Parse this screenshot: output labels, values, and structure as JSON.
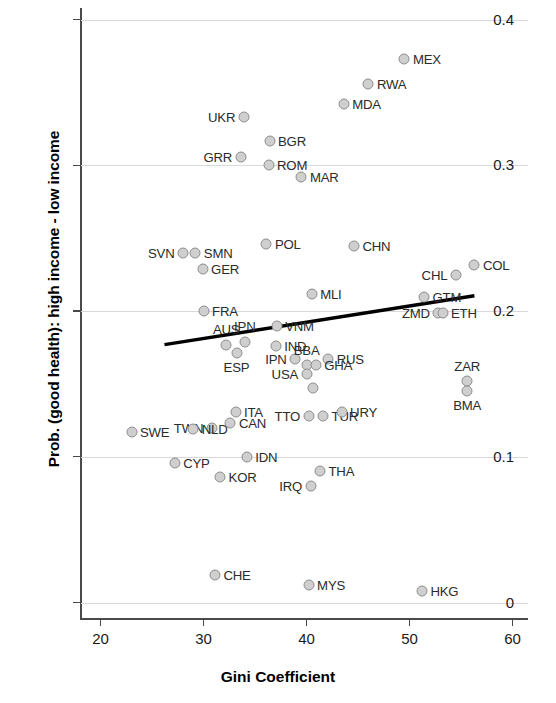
{
  "chart_data": {
    "type": "scatter",
    "title": "",
    "xlabel": "Gini Coefficient",
    "ylabel": "Prob. (good health): high income - low income",
    "xlim": [
      18,
      61.5
    ],
    "ylim": [
      -0.012,
      0.408
    ],
    "xticks": [
      20,
      30,
      40,
      50,
      60
    ],
    "xtick_labels": [
      "20",
      "30",
      "40",
      "50",
      "60"
    ],
    "yticks": [
      0,
      0.1,
      0.2,
      0.3,
      0.4
    ],
    "ytick_labels": [
      "0",
      "0.1",
      "0.2",
      "0.3",
      "0.4"
    ],
    "grid": "horizontal",
    "legend": "none",
    "marker_fill": "#cfcfcf",
    "marker_edge": "#8e8e8e",
    "fit_line_color": "#000000",
    "fit_line": {
      "x0": 26.2,
      "y0": 0.177,
      "x1": 56.3,
      "y1": 0.2105
    },
    "points": [
      {
        "label": "MEX",
        "x": 49.5,
        "y": 0.373,
        "pos": "r"
      },
      {
        "label": "RWA",
        "x": 46.0,
        "y": 0.356,
        "pos": "r"
      },
      {
        "label": "MDA",
        "x": 43.6,
        "y": 0.342,
        "pos": "r"
      },
      {
        "label": "UKR",
        "x": 33.9,
        "y": 0.333,
        "pos": "l"
      },
      {
        "label": "BGR",
        "x": 36.4,
        "y": 0.317,
        "pos": "r"
      },
      {
        "label": "GRR",
        "x": 33.6,
        "y": 0.306,
        "pos": "l"
      },
      {
        "label": "ROM",
        "x": 36.3,
        "y": 0.3,
        "pos": "r"
      },
      {
        "label": "MAR",
        "x": 39.5,
        "y": 0.292,
        "pos": "r"
      },
      {
        "label": "POL",
        "x": 36.1,
        "y": 0.246,
        "pos": "r"
      },
      {
        "label": "CHN",
        "x": 44.6,
        "y": 0.245,
        "pos": "r"
      },
      {
        "label": "SVN",
        "x": 28.0,
        "y": 0.24,
        "pos": "l"
      },
      {
        "label": "SMN",
        "x": 29.2,
        "y": 0.24,
        "pos": "r"
      },
      {
        "label": "COL",
        "x": 56.3,
        "y": 0.232,
        "pos": "r"
      },
      {
        "label": "GER",
        "x": 29.9,
        "y": 0.229,
        "pos": "r"
      },
      {
        "label": "CHL",
        "x": 54.5,
        "y": 0.225,
        "pos": "l"
      },
      {
        "label": "MLI",
        "x": 40.5,
        "y": 0.212,
        "pos": "r"
      },
      {
        "label": "GTM",
        "x": 51.4,
        "y": 0.21,
        "pos": "r"
      },
      {
        "label": "ZMD",
        "x": 52.8,
        "y": 0.199,
        "pos": "l"
      },
      {
        "label": "ETH",
        "x": 53.2,
        "y": 0.199,
        "pos": "r"
      },
      {
        "label": "FRA",
        "x": 30.0,
        "y": 0.2,
        "pos": "r"
      },
      {
        "label": "VNM",
        "x": 37.1,
        "y": 0.19,
        "pos": "r"
      },
      {
        "label": "AUS",
        "x": 32.2,
        "y": 0.177,
        "pos": "t"
      },
      {
        "label": "IPN",
        "x": 34.0,
        "y": 0.179,
        "pos": "t"
      },
      {
        "label": "IND",
        "x": 37.0,
        "y": 0.176,
        "pos": "r"
      },
      {
        "label": "ESP",
        "x": 33.2,
        "y": 0.171,
        "pos": "b"
      },
      {
        "label": "IPN",
        "x": 38.9,
        "y": 0.167,
        "pos": "l"
      },
      {
        "label": "BBA",
        "x": 40.0,
        "y": 0.163,
        "pos": "t"
      },
      {
        "label": "RUS",
        "x": 42.1,
        "y": 0.167,
        "pos": "r"
      },
      {
        "label": "USA",
        "x": 40.0,
        "y": 0.157,
        "pos": "l"
      },
      {
        "label": "GHA",
        "x": 40.9,
        "y": 0.163,
        "pos": "r"
      },
      {
        "label": "ZAR",
        "x": 55.6,
        "y": 0.152,
        "pos": "t"
      },
      {
        "label": "BMA",
        "x": 55.6,
        "y": 0.145,
        "pos": "b"
      },
      {
        "label": "",
        "x": 40.6,
        "y": 0.147,
        "pos": "r"
      },
      {
        "label": "ITA",
        "x": 33.1,
        "y": 0.131,
        "pos": "r"
      },
      {
        "label": "TTO",
        "x": 40.2,
        "y": 0.128,
        "pos": "l"
      },
      {
        "label": "TUR",
        "x": 41.6,
        "y": 0.128,
        "pos": "r"
      },
      {
        "label": "URY",
        "x": 43.4,
        "y": 0.131,
        "pos": "r"
      },
      {
        "label": "CAN",
        "x": 32.6,
        "y": 0.123,
        "pos": "r"
      },
      {
        "label": "TWN",
        "x": 30.8,
        "y": 0.12,
        "pos": "l"
      },
      {
        "label": "NLD",
        "x": 29.0,
        "y": 0.119,
        "pos": "r"
      },
      {
        "label": "SWE",
        "x": 23.0,
        "y": 0.117,
        "pos": "r"
      },
      {
        "label": "IDN",
        "x": 34.2,
        "y": 0.1,
        "pos": "r"
      },
      {
        "label": "CYP",
        "x": 27.2,
        "y": 0.096,
        "pos": "r"
      },
      {
        "label": "KOR",
        "x": 31.6,
        "y": 0.086,
        "pos": "r"
      },
      {
        "label": "THA",
        "x": 41.3,
        "y": 0.09,
        "pos": "r"
      },
      {
        "label": "IRQ",
        "x": 40.4,
        "y": 0.08,
        "pos": "l"
      },
      {
        "label": "CHE",
        "x": 31.1,
        "y": 0.019,
        "pos": "r"
      },
      {
        "label": "MYS",
        "x": 40.2,
        "y": 0.012,
        "pos": "r"
      },
      {
        "label": "HKG",
        "x": 51.2,
        "y": 0.008,
        "pos": "r"
      }
    ]
  }
}
